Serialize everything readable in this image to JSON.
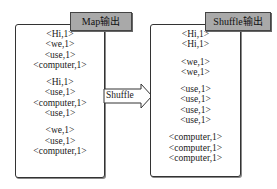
{
  "map_panel": {
    "title": "Map输出",
    "groups": [
      [
        "<Hi,1>",
        "<we,1>",
        "<use,1>",
        "<computer,1>"
      ],
      [
        "<Hi,1>",
        "<use,1>",
        "<computer,1>",
        "<use,1>"
      ],
      [
        "<we,1>",
        "<use,1>",
        "<computer,1>"
      ]
    ]
  },
  "arrow": {
    "label": "Shuffle"
  },
  "shuffle_panel": {
    "title": "Shuffle输出",
    "groups": [
      [
        "<Hi,1>",
        "<Hi,1>"
      ],
      [
        "<we,1>",
        "<we,1>"
      ],
      [
        "<use,1>",
        "<use,1>",
        "<use,1>",
        "<use,1>"
      ],
      [
        "<computer,1>",
        "<computer,1>",
        "<computer,1>"
      ]
    ]
  }
}
